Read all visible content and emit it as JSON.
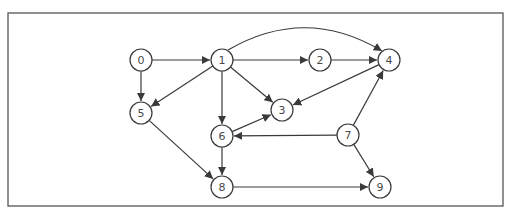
{
  "diagram": {
    "type": "directed-graph",
    "frame": {
      "x": 8,
      "y": 13,
      "width": 495,
      "height": 193
    },
    "style": {
      "stroke": "#3a3a3a",
      "frame_stroke": "#555555",
      "node_fill": "#ffffff",
      "label_color": "#4a4a4a"
    },
    "node_radius": 11,
    "nodes": [
      {
        "id": "0",
        "label": "0",
        "x": 141,
        "y": 60
      },
      {
        "id": "1",
        "label": "1",
        "x": 222,
        "y": 60
      },
      {
        "id": "2",
        "label": "2",
        "x": 320,
        "y": 60
      },
      {
        "id": "3",
        "label": "3",
        "x": 282,
        "y": 110
      },
      {
        "id": "4",
        "label": "4",
        "x": 389,
        "y": 60
      },
      {
        "id": "5",
        "label": "5",
        "x": 141,
        "y": 113
      },
      {
        "id": "6",
        "label": "6",
        "x": 222,
        "y": 136
      },
      {
        "id": "7",
        "label": "7",
        "x": 348,
        "y": 135
      },
      {
        "id": "8",
        "label": "8",
        "x": 222,
        "y": 187
      },
      {
        "id": "9",
        "label": "9",
        "x": 380,
        "y": 187
      }
    ],
    "edges": [
      {
        "from": "0",
        "to": "1"
      },
      {
        "from": "0",
        "to": "5"
      },
      {
        "from": "1",
        "to": "2"
      },
      {
        "from": "1",
        "to": "4",
        "curved": true
      },
      {
        "from": "1",
        "to": "5"
      },
      {
        "from": "1",
        "to": "6"
      },
      {
        "from": "1",
        "to": "3"
      },
      {
        "from": "2",
        "to": "4"
      },
      {
        "from": "4",
        "to": "3"
      },
      {
        "from": "5",
        "to": "8"
      },
      {
        "from": "6",
        "to": "3"
      },
      {
        "from": "6",
        "to": "8"
      },
      {
        "from": "7",
        "to": "6"
      },
      {
        "from": "7",
        "to": "4"
      },
      {
        "from": "7",
        "to": "9"
      },
      {
        "from": "8",
        "to": "9"
      }
    ]
  }
}
